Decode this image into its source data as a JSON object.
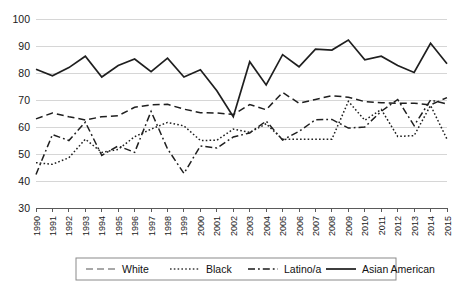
{
  "chart_data": {
    "type": "line",
    "title": "",
    "subtitle": "",
    "xlabel": "",
    "ylabel": "",
    "xlim": [
      1990,
      2015
    ],
    "ylim": [
      30,
      100
    ],
    "yticks": [
      30,
      40,
      50,
      60,
      70,
      80,
      90,
      100
    ],
    "grid": true,
    "legend_position": "bottom",
    "categories": [
      "1990",
      "1991",
      "1992",
      "1993",
      "1994",
      "1995",
      "1996",
      "1997",
      "1998",
      "1999",
      "2000",
      "2001",
      "2002",
      "2003",
      "2004",
      "2005",
      "2006",
      "2007",
      "2008",
      "2009",
      "2010",
      "2011",
      "2012",
      "2013",
      "2014",
      "2015"
    ],
    "series": [
      {
        "name": "White",
        "style": "dashed",
        "color": "#8c8c8c",
        "values": [
          63.0,
          65.2,
          63.8,
          62.6,
          63.8,
          64.2,
          67.3,
          68.2,
          68.4,
          66.6,
          65.3,
          65.2,
          64.6,
          68.3,
          66.4,
          72.8,
          68.8,
          70.2,
          71.6,
          71.0,
          69.4,
          69.0,
          68.8,
          68.8,
          68.2,
          70.9
        ]
      },
      {
        "name": "Black",
        "style": "dotted",
        "color": "#3a3a3a",
        "values": [
          46.8,
          46.2,
          48.6,
          55.5,
          50.6,
          51.7,
          56.4,
          59.2,
          61.7,
          60.4,
          55.0,
          55.1,
          59.2,
          58.0,
          61.2,
          55.4,
          55.5,
          55.5,
          55.5,
          69.5,
          62.5,
          66.5,
          56.5,
          56.8,
          68.0,
          55.5
        ]
      },
      {
        "name": "Latino/a",
        "style": "dashdot",
        "color": "#1a1a1a",
        "values": [
          42.4,
          57.2,
          55.0,
          61.8,
          49.5,
          53.0,
          50.6,
          65.8,
          51.9,
          42.8,
          53.0,
          52.2,
          56.3,
          57.8,
          62.2,
          55.2,
          58.4,
          62.7,
          62.8,
          59.6,
          60.0,
          65.8,
          70.2,
          60.5,
          70.0,
          68.5
        ]
      },
      {
        "name": "Asian American",
        "style": "solid",
        "color": "#1a1a1a",
        "values": [
          81.4,
          79.0,
          82.0,
          86.2,
          78.5,
          82.8,
          85.2,
          80.5,
          85.5,
          78.5,
          81.2,
          73.4,
          63.8,
          84.2,
          75.6,
          86.8,
          82.3,
          88.8,
          88.5,
          92.2,
          84.9,
          86.2,
          82.8,
          80.2,
          91.0,
          83.4
        ]
      }
    ]
  },
  "legend": {
    "items": [
      {
        "label": "White"
      },
      {
        "label": "Black"
      },
      {
        "label": "Latino/a"
      },
      {
        "label": "Asian American"
      }
    ]
  }
}
